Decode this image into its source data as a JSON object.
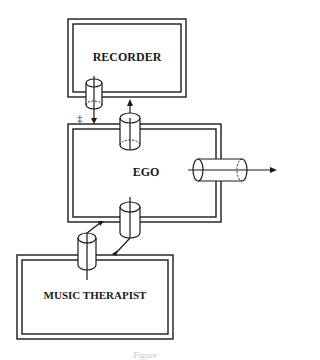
{
  "diagram": {
    "nodes": [
      {
        "id": "recorder",
        "label": "RECORDER",
        "x": 127,
        "y": 57
      },
      {
        "id": "ego",
        "label": "EGO",
        "x": 146,
        "y": 172
      },
      {
        "id": "music_therapist",
        "label": "MUSIC THERAPIST",
        "x": 95,
        "y": 295
      }
    ],
    "connectors": [
      {
        "from": "recorder",
        "to": "ego",
        "type": "cylinder-channel",
        "direction": "down"
      },
      {
        "from": "ego",
        "to": "recorder",
        "type": "cylinder-channel",
        "direction": "up"
      },
      {
        "from": "ego",
        "to": "outside",
        "type": "cylinder-channel",
        "direction": "right"
      },
      {
        "from": "ego",
        "to": "music_therapist",
        "type": "cylinder-channel",
        "direction": "down"
      },
      {
        "from": "music_therapist",
        "to": "ego",
        "type": "cylinder-channel",
        "direction": "up"
      }
    ],
    "bidirectional_marker": "‡",
    "caption": "Figure"
  }
}
